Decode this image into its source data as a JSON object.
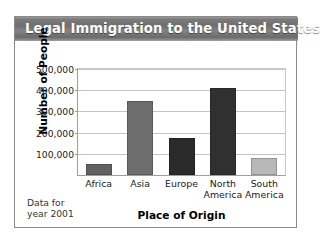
{
  "chart_data": {
    "type": "bar",
    "title": "Legal Immigration to the United States",
    "xlabel": "Place of Origin",
    "ylabel": "Number of People",
    "categories": [
      "Africa",
      "Asia",
      "Europe",
      "North America",
      "South America"
    ],
    "values": [
      50000,
      350000,
      175000,
      410000,
      80000
    ],
    "bar_colors": [
      "#616161",
      "#6e6e6e",
      "#2a2a2a",
      "#303030",
      "#b8b8b8"
    ],
    "ylim": [
      0,
      500000
    ],
    "yticks": [
      100000,
      200000,
      300000,
      400000,
      500000
    ],
    "ytick_labels": [
      "100,000",
      "200,000",
      "300,000",
      "400,000",
      "500,000"
    ],
    "grid": true,
    "legend": "none",
    "annotation": "Data for\nyear 2001"
  },
  "colors": {
    "title_bar_text": "#ffffff",
    "frame_border": "#8a8a8a",
    "gridline": "#c4c4c4",
    "axis": "#9f9f9f"
  }
}
